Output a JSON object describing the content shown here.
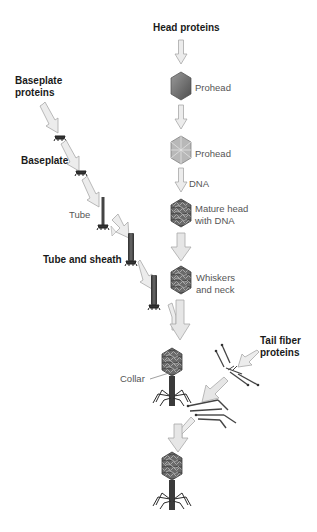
{
  "diagram": {
    "type": "assembly-pathway",
    "colors": {
      "arrow_fill": "#ebebeb",
      "arrow_stroke": "#a8a8a8",
      "head_dark": "#5a5a5a",
      "head_light": "#a0a0a0",
      "tail_dark": "#3a3a3a",
      "label_bold": "#1a1a1a",
      "label_normal": "#555555"
    },
    "head_pathway": {
      "source_label": "Head proteins",
      "steps": [
        {
          "label": "Prohead"
        },
        {
          "label": "Prohead"
        },
        {
          "label": "DNA"
        },
        {
          "label_line1": "Mature head",
          "label_line2": "with DNA"
        },
        {
          "label_line1": "Whiskers",
          "label_line2": "and neck"
        }
      ]
    },
    "tail_pathway": {
      "source_label_line1": "Baseplate",
      "source_label_line2": "proteins",
      "steps": [
        {
          "label": "Baseplate"
        },
        {
          "label": "Tube"
        },
        {
          "label": "Tube and sheath"
        }
      ]
    },
    "fiber_pathway": {
      "source_label_line1": "Tail fiber",
      "source_label_line2": "proteins"
    },
    "assembled": {
      "collar_label": "Collar"
    }
  }
}
